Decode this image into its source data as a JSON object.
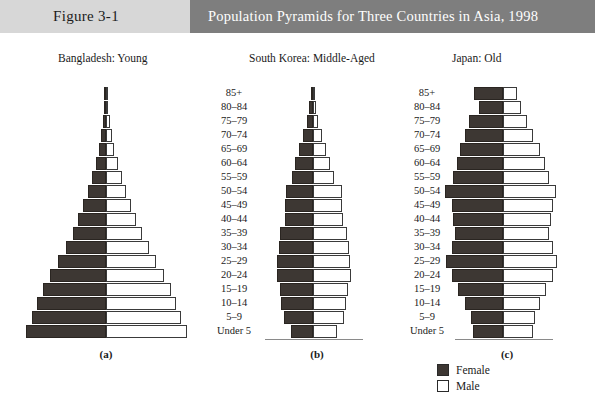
{
  "header": {
    "figure_number": "Figure 3-1",
    "title": "Population Pyramids for Three Countries in Asia, 1998",
    "figure_band_color": "#d7d7d7",
    "title_band_color": "#7e7e7e",
    "title_text_color": "#ffffff"
  },
  "legend": {
    "items": [
      {
        "label": "Female",
        "swatch": "female",
        "color": "#3d3733"
      },
      {
        "label": "Male",
        "swatch": "male",
        "color": "#ffffff"
      }
    ]
  },
  "age_axis": {
    "labels": [
      "85+",
      "80–84",
      "75–79",
      "70–74",
      "65–69",
      "60–64",
      "55–59",
      "50–54",
      "45–49",
      "40–44",
      "35–39",
      "30–34",
      "25–29",
      "20–24",
      "15–19",
      "10–14",
      "5–9",
      "Under 5"
    ]
  },
  "chart_data": {
    "type": "bar",
    "subtype": "population-pyramid",
    "title": "Population Pyramids for Three Countries in Asia, 1998",
    "xlabel": "",
    "ylabel": "Age group",
    "categories": [
      "85+",
      "80–84",
      "75–79",
      "70–74",
      "65–69",
      "60–64",
      "55–59",
      "50–54",
      "45–49",
      "40–44",
      "35–39",
      "30–34",
      "25–29",
      "20–24",
      "15–19",
      "10–14",
      "5–9",
      "Under 5"
    ],
    "legend": [
      "Female",
      "Male"
    ],
    "legend_position": "bottom-right",
    "grid": false,
    "note": "Bar values are relative share of total population per age group, read off the drawn bar widths (arbitrary units, symmetric axis).",
    "panels": [
      {
        "id": "a",
        "caption": "(a)",
        "country": "Bangladesh",
        "descriptor": "Young",
        "label": "Bangladesh: Young",
        "center_x": 106,
        "series": [
          {
            "name": "Female",
            "values": [
              1.5,
              2.5,
              3.5,
              5.5,
              8.0,
              11.0,
              15.0,
              19.5,
              24.5,
              30.0,
              36.0,
              43.5,
              51.5,
              60.0,
              67.5,
              74.0,
              80.0,
              86.0
            ]
          },
          {
            "name": "Male",
            "values": [
              1.5,
              2.5,
              4.0,
              6.0,
              9.0,
              12.5,
              17.0,
              21.5,
              27.0,
              32.5,
              38.5,
              46.0,
              54.0,
              62.0,
              69.5,
              75.5,
              81.0,
              87.0
            ]
          }
        ]
      },
      {
        "id": "b",
        "caption": "(b)",
        "country": "South Korea",
        "descriptor": "Middle-Aged",
        "label": "South Korea: Middle-Aged",
        "center_x": 313,
        "series": [
          {
            "name": "Female",
            "values": [
              2.5,
              5.0,
              9.0,
              14.5,
              20.0,
              24.5,
              29.0,
              37.5,
              38.5,
              39.0,
              46.0,
              47.5,
              49.5,
              50.5,
              46.5,
              44.0,
              40.0,
              31.0
            ]
          },
          {
            "name": "Male",
            "values": [
              2.0,
              4.0,
              7.0,
              12.0,
              18.0,
              23.5,
              29.5,
              40.0,
              40.5,
              41.5,
              47.5,
              49.5,
              51.5,
              52.5,
              49.0,
              46.5,
              42.5,
              33.0
            ]
          }
        ]
      },
      {
        "id": "c",
        "caption": "(c)",
        "country": "Japan",
        "descriptor": "Old",
        "label": "Japan: Old",
        "center_x": 503,
        "series": [
          {
            "name": "Female",
            "values": [
              36.0,
              30.0,
              42.0,
              48.0,
              54.0,
              58.0,
              62.0,
              73.0,
              64.0,
              62.0,
              60.0,
              64.0,
              71.0,
              64.0,
              56.0,
              48.0,
              40.0,
              38.0
            ]
          },
          {
            "name": "Male",
            "values": [
              18.0,
              22.0,
              30.0,
              38.0,
              46.0,
              52.0,
              58.0,
              66.0,
              62.0,
              60.0,
              58.0,
              62.0,
              68.0,
              62.0,
              54.0,
              46.0,
              40.0,
              38.0
            ]
          }
        ]
      }
    ]
  },
  "panel_layout": {
    "a": {
      "label_left": 58,
      "caption_left": 76,
      "scale": 0.93,
      "baseline": false
    },
    "b": {
      "label_left": 249,
      "caption_left": 297,
      "scale": 0.72,
      "baseline": true,
      "baseline_left": -48,
      "baseline_width": 98
    },
    "c": {
      "label_left": 452,
      "caption_left": 487,
      "scale": 0.8,
      "baseline": true,
      "baseline_left": -48,
      "baseline_width": 98
    }
  }
}
